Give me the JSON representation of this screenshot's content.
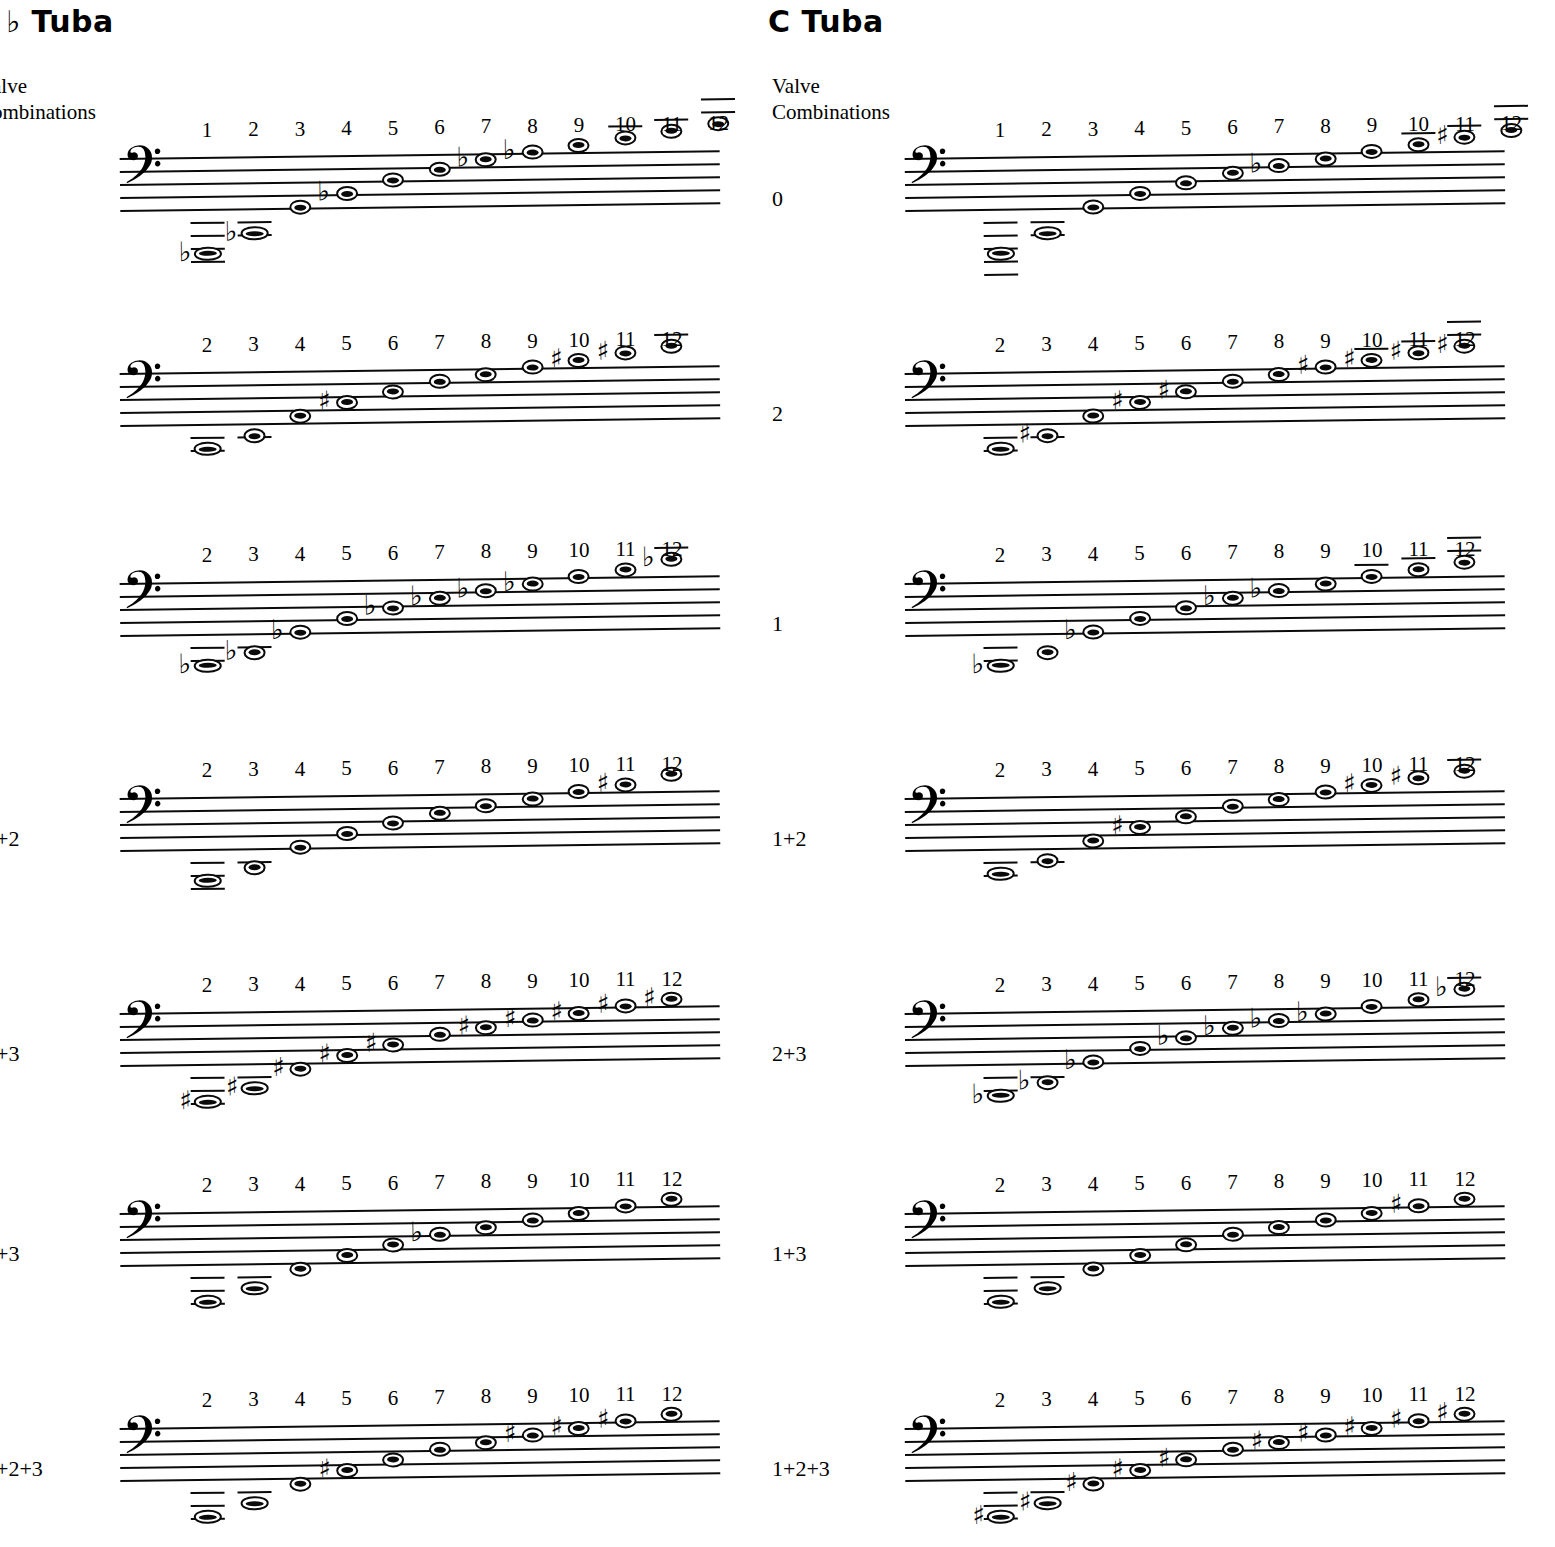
{
  "page": {
    "background": "#ffffff",
    "ink": "#0a0a0a"
  },
  "columns": [
    {
      "id": "bb-tuba",
      "title": "♭ Tuba",
      "title_note": "B-flat Tuba (left edge of title is cropped off the page)",
      "valve_heading": "alve\nombinations",
      "valve_heading_full": "Valve Combinations (left edge cropped)",
      "clef": "bass-clef",
      "clef_glyph": "𝄢"
    },
    {
      "id": "c-tuba",
      "title": "C  Tuba",
      "valve_heading": "Valve\nCombinations",
      "valve_heading_full": "Valve Combinations",
      "clef": "bass-clef",
      "clef_glyph": "𝄢"
    }
  ],
  "accidental_glyphs": {
    "flat": "♭",
    "sharp": "♯",
    "natural": ""
  },
  "chart_data": {
    "type": "table",
    "subtitle": "B♭ Tuba and C Tuba — partials 1–12 for each valve combination",
    "xlabel": "Harmonic partial number",
    "ylabel": "Pitch (bass clef staff position)",
    "notation": "Staff positions are given as diatonic steps above the bottom staff line (step 0 = bottom line G2; each step = one scale degree; 8 = top line A3).",
    "systems": [
      {
        "column": "bb-tuba",
        "valve": "0",
        "valve_label_visible": "",
        "partials": [
          1,
          2,
          3,
          4,
          5,
          6,
          7,
          8,
          9,
          10,
          11,
          12
        ],
        "accidentals": [
          "flat",
          "flat",
          "",
          "flat",
          "",
          "",
          "flat",
          "flat",
          "",
          "",
          "",
          ""
        ],
        "steps": [
          -7,
          -4,
          0,
          2,
          4,
          5.5,
          7,
          8,
          9,
          10,
          11,
          12
        ],
        "ledgers_below": [
          4,
          2,
          0,
          0,
          0,
          0,
          0,
          0,
          0,
          0,
          0,
          0
        ],
        "ledgers_above": [
          0,
          0,
          0,
          0,
          0,
          0,
          0,
          0,
          0,
          1,
          1,
          2
        ]
      },
      {
        "column": "bb-tuba",
        "valve": "2",
        "valve_label_visible": "",
        "partials": [
          2,
          3,
          4,
          5,
          6,
          7,
          8,
          9,
          10,
          11,
          12
        ],
        "accidentals": [
          "",
          "",
          "",
          "sharp",
          "",
          "",
          "",
          "",
          "sharp",
          "sharp",
          ""
        ],
        "steps": [
          -4,
          -2,
          1,
          3,
          4.5,
          6,
          7,
          8,
          9,
          10,
          11
        ],
        "ledgers_below": [
          2,
          1,
          0,
          0,
          0,
          0,
          0,
          0,
          0,
          0,
          0
        ],
        "ledgers_above": [
          0,
          0,
          0,
          0,
          0,
          0,
          0,
          0,
          0,
          0,
          1
        ]
      },
      {
        "column": "bb-tuba",
        "valve": "1",
        "valve_label_visible": "",
        "partials": [
          2,
          3,
          4,
          5,
          6,
          7,
          8,
          9,
          10,
          11,
          12
        ],
        "accidentals": [
          "flat",
          "flat",
          "flat",
          "",
          "flat",
          "flat",
          "flat",
          "flat",
          "",
          "",
          "flat"
        ],
        "steps": [
          -5,
          -3,
          0,
          2,
          3.5,
          5,
          6,
          7,
          8,
          9,
          10.5
        ],
        "ledgers_below": [
          2,
          1,
          0,
          0,
          0,
          0,
          0,
          0,
          0,
          0,
          0
        ],
        "ledgers_above": [
          0,
          0,
          0,
          0,
          0,
          0,
          0,
          0,
          0,
          0,
          1
        ]
      },
      {
        "column": "bb-tuba",
        "valve": "1+2",
        "valve_label_visible": "+2",
        "partials": [
          2,
          3,
          4,
          5,
          6,
          7,
          8,
          9,
          10,
          11,
          12
        ],
        "accidentals": [
          "",
          "",
          "",
          "",
          "",
          "",
          "",
          "",
          "",
          "sharp",
          ""
        ],
        "steps": [
          -5,
          -3,
          0,
          2,
          3.5,
          5,
          6,
          7,
          8,
          9,
          10.5
        ],
        "ledgers_below": [
          3,
          1,
          0,
          0,
          0,
          0,
          0,
          0,
          0,
          0,
          0
        ],
        "ledgers_above": [
          0,
          0,
          0,
          0,
          0,
          0,
          0,
          0,
          0,
          0,
          0
        ]
      },
      {
        "column": "bb-tuba",
        "valve": "2+3",
        "valve_label_visible": "+3",
        "partials": [
          2,
          3,
          4,
          5,
          6,
          7,
          8,
          9,
          10,
          11,
          12
        ],
        "accidentals": [
          "sharp",
          "sharp",
          "sharp",
          "sharp",
          "sharp",
          "",
          "sharp",
          "sharp",
          "sharp",
          "sharp",
          "sharp"
        ],
        "steps": [
          -6,
          -4,
          -1,
          1,
          2.5,
          4,
          5,
          6,
          7,
          8,
          9
        ],
        "ledgers_below": [
          3,
          1,
          0,
          0,
          0,
          0,
          0,
          0,
          0,
          0,
          0
        ],
        "ledgers_above": [
          0,
          0,
          0,
          0,
          0,
          0,
          0,
          0,
          0,
          0,
          0
        ]
      },
      {
        "column": "bb-tuba",
        "valve": "1+3",
        "valve_label_visible": "+3",
        "partials": [
          2,
          3,
          4,
          5,
          6,
          7,
          8,
          9,
          10,
          11,
          12
        ],
        "accidentals": [
          "",
          "",
          "",
          "",
          "",
          "flat",
          "",
          "",
          "",
          "",
          ""
        ],
        "steps": [
          -6,
          -4,
          -1,
          1,
          2.5,
          4,
          5,
          6,
          7,
          8,
          9
        ],
        "ledgers_below": [
          3,
          1,
          0,
          0,
          0,
          0,
          0,
          0,
          0,
          0,
          0
        ],
        "ledgers_above": [
          0,
          0,
          0,
          0,
          0,
          0,
          0,
          0,
          0,
          0,
          0
        ]
      },
      {
        "column": "bb-tuba",
        "valve": "1+2+3",
        "valve_label_visible": "+2+3",
        "partials": [
          2,
          3,
          4,
          5,
          6,
          7,
          8,
          9,
          10,
          11,
          12
        ],
        "accidentals": [
          "",
          "",
          "",
          "sharp",
          "",
          "",
          "",
          "sharp",
          "sharp",
          "sharp",
          ""
        ],
        "steps": [
          -6,
          -4,
          -1,
          1,
          2.5,
          4,
          5,
          6,
          7,
          8,
          9
        ],
        "ledgers_below": [
          3,
          1,
          0,
          0,
          0,
          0,
          0,
          0,
          0,
          0,
          0
        ],
        "ledgers_above": [
          0,
          0,
          0,
          0,
          0,
          0,
          0,
          0,
          0,
          0,
          0
        ]
      },
      {
        "column": "c-tuba",
        "valve": "0",
        "valve_label_visible": "0",
        "partials": [
          1,
          2,
          3,
          4,
          5,
          6,
          7,
          8,
          9,
          10,
          11,
          12
        ],
        "accidentals": [
          "",
          "",
          "",
          "",
          "",
          "",
          "flat",
          "",
          "",
          "",
          "sharp",
          ""
        ],
        "steps": [
          -7,
          -4,
          0,
          2,
          3.5,
          5,
          6,
          7,
          8,
          9,
          10,
          11
        ],
        "ledgers_below": [
          5,
          2,
          0,
          0,
          0,
          0,
          0,
          0,
          0,
          0,
          0,
          0
        ],
        "ledgers_above": [
          0,
          0,
          0,
          0,
          0,
          0,
          0,
          0,
          0,
          1,
          1,
          2
        ]
      },
      {
        "column": "c-tuba",
        "valve": "2",
        "valve_label_visible": "2",
        "partials": [
          2,
          3,
          4,
          5,
          6,
          7,
          8,
          9,
          10,
          11,
          12
        ],
        "accidentals": [
          "",
          "sharp",
          "",
          "sharp",
          "sharp",
          "",
          "",
          "sharp",
          "sharp",
          "sharp",
          "sharp"
        ],
        "steps": [
          -4,
          -2,
          1,
          3,
          4.5,
          6,
          7,
          8,
          9,
          10,
          11
        ],
        "ledgers_below": [
          2,
          1,
          0,
          0,
          0,
          0,
          0,
          0,
          0,
          0,
          0
        ],
        "ledgers_above": [
          0,
          0,
          0,
          0,
          0,
          0,
          0,
          0,
          1,
          1,
          2
        ]
      },
      {
        "column": "c-tuba",
        "valve": "1",
        "valve_label_visible": "1",
        "partials": [
          2,
          3,
          4,
          5,
          6,
          7,
          8,
          9,
          10,
          11,
          12
        ],
        "accidentals": [
          "flat",
          "",
          "flat",
          "",
          "",
          "flat",
          "flat",
          "",
          "",
          "",
          ""
        ],
        "steps": [
          -5,
          -3,
          0,
          2,
          3.5,
          5,
          6,
          7,
          8,
          9,
          10
        ],
        "ledgers_below": [
          2,
          0,
          0,
          0,
          0,
          0,
          0,
          0,
          0,
          0,
          0
        ],
        "ledgers_above": [
          0,
          0,
          0,
          0,
          0,
          0,
          0,
          0,
          1,
          1,
          2
        ]
      },
      {
        "column": "c-tuba",
        "valve": "1+2",
        "valve_label_visible": "1+2",
        "partials": [
          2,
          3,
          4,
          5,
          6,
          7,
          8,
          9,
          10,
          11,
          12
        ],
        "accidentals": [
          "",
          "",
          "",
          "sharp",
          "",
          "",
          "",
          "",
          "sharp",
          "sharp",
          ""
        ],
        "steps": [
          -4,
          -2,
          1,
          3,
          4.5,
          6,
          7,
          8,
          9,
          10,
          11
        ],
        "ledgers_below": [
          2,
          1,
          0,
          0,
          0,
          0,
          0,
          0,
          0,
          0,
          0
        ],
        "ledgers_above": [
          0,
          0,
          0,
          0,
          0,
          0,
          0,
          0,
          0,
          0,
          1
        ]
      },
      {
        "column": "c-tuba",
        "valve": "2+3",
        "valve_label_visible": "2+3",
        "partials": [
          2,
          3,
          4,
          5,
          6,
          7,
          8,
          9,
          10,
          11,
          12
        ],
        "accidentals": [
          "flat",
          "flat",
          "flat",
          "",
          "flat",
          "flat",
          "flat",
          "flat",
          "",
          "",
          "flat"
        ],
        "steps": [
          -5,
          -3,
          0,
          2,
          3.5,
          5,
          6,
          7,
          8,
          9,
          10.5
        ],
        "ledgers_below": [
          2,
          1,
          0,
          0,
          0,
          0,
          0,
          0,
          0,
          0,
          0
        ],
        "ledgers_above": [
          0,
          0,
          0,
          0,
          0,
          0,
          0,
          0,
          0,
          0,
          1
        ]
      },
      {
        "column": "c-tuba",
        "valve": "1+3",
        "valve_label_visible": "1+3",
        "partials": [
          2,
          3,
          4,
          5,
          6,
          7,
          8,
          9,
          10,
          11,
          12
        ],
        "accidentals": [
          "",
          "",
          "",
          "",
          "",
          "",
          "",
          "",
          "",
          "sharp",
          ""
        ],
        "steps": [
          -6,
          -4,
          -1,
          1,
          2.5,
          4,
          5,
          6,
          7,
          8,
          9
        ],
        "ledgers_below": [
          3,
          1,
          0,
          0,
          0,
          0,
          0,
          0,
          0,
          0,
          0
        ],
        "ledgers_above": [
          0,
          0,
          0,
          0,
          0,
          0,
          0,
          0,
          0,
          0,
          0
        ]
      },
      {
        "column": "c-tuba",
        "valve": "1+2+3",
        "valve_label_visible": "1+2+3",
        "partials": [
          2,
          3,
          4,
          5,
          6,
          7,
          8,
          9,
          10,
          11,
          12
        ],
        "accidentals": [
          "sharp",
          "sharp",
          "sharp",
          "sharp",
          "sharp",
          "",
          "sharp",
          "sharp",
          "sharp",
          "sharp",
          "sharp"
        ],
        "steps": [
          -6,
          -4,
          -1,
          1,
          2.5,
          4,
          5,
          6,
          7,
          8,
          9
        ],
        "ledgers_below": [
          3,
          1,
          0,
          0,
          0,
          0,
          0,
          0,
          0,
          0,
          0
        ],
        "ledgers_above": [
          0,
          0,
          0,
          0,
          0,
          0,
          0,
          0,
          0,
          0,
          0
        ]
      }
    ]
  },
  "layout": {
    "column_x": {
      "bb-tuba": 0,
      "c-tuba": 765
    },
    "system_y": [
      118,
      333,
      543,
      758,
      973,
      1173,
      1388
    ],
    "staff_left": {
      "bb-tuba": 120,
      "c-tuba": 905
    },
    "staff_width": 600,
    "line_gap": 13,
    "partial_x_start": {
      "bb-tuba": 207,
      "c-tuba": 1000
    },
    "partial_x_step": 46.5
  }
}
